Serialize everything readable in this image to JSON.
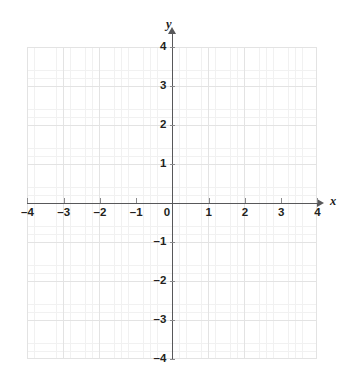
{
  "figure": {
    "title": "",
    "background_color": "#ffffff"
  },
  "axes": {
    "x_axis_label": "x",
    "y_axis_label": "y",
    "axis_color": "#58585a",
    "major_grid_color": "#e3e3e3",
    "minor_grid_color": "#f1f1f1",
    "label_color": "#231f20"
  },
  "chart_data": {
    "type": "scatter",
    "title": "",
    "subtitle": "",
    "xlabel": "x",
    "ylabel": "y",
    "xlim": [
      -4,
      4
    ],
    "ylim": [
      -4,
      4
    ],
    "xticks": [
      -4,
      -3,
      -2,
      -1,
      0,
      1,
      2,
      3,
      4
    ],
    "yticks": [
      4,
      3,
      2,
      1,
      0,
      -1,
      -2,
      -3,
      -4
    ],
    "xtick_labels": [
      "–4",
      "–3",
      "–2",
      "–1",
      "0",
      "1",
      "2",
      "3",
      "4"
    ],
    "ytick_labels": [
      "4",
      "3",
      "2",
      "1",
      "0",
      "–1",
      "–2",
      "–3",
      "–4"
    ],
    "grid": true,
    "minor_grid": true,
    "minor_ticks_per_unit": 5,
    "legend": null,
    "series": [],
    "annotations": []
  }
}
